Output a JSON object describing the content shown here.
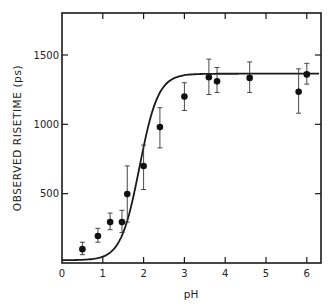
{
  "chart_data": {
    "type": "scatter",
    "title": "",
    "xlabel": "pH",
    "ylabel": "OBSERVED RISETIME (ps)",
    "xlim": [
      0,
      6.3
    ],
    "ylim": [
      0,
      1800
    ],
    "x_ticks": [
      0,
      1,
      2,
      3,
      4,
      5,
      6
    ],
    "y_ticks": [
      500,
      1000,
      1500
    ],
    "x_tick_labels": [
      "0",
      "1",
      "2",
      "3",
      "4",
      "5",
      "6"
    ],
    "y_tick_labels": [
      "500",
      "1000",
      "1500"
    ],
    "grid": false,
    "legend": null,
    "series": [
      {
        "name": "measured",
        "marker": "filled-circle",
        "points": [
          {
            "x": 0.5,
            "y": 100,
            "err_low": 60,
            "err_high": 150
          },
          {
            "x": 0.88,
            "y": 195,
            "err_low": 150,
            "err_high": 250
          },
          {
            "x": 1.18,
            "y": 295,
            "err_low": 240,
            "err_high": 360
          },
          {
            "x": 1.47,
            "y": 295,
            "err_low": 220,
            "err_high": 380
          },
          {
            "x": 1.6,
            "y": 497,
            "err_low": 295,
            "err_high": 700
          },
          {
            "x": 2.0,
            "y": 700,
            "err_low": 530,
            "err_high": 850
          },
          {
            "x": 2.4,
            "y": 980,
            "err_low": 830,
            "err_high": 1120
          },
          {
            "x": 3.0,
            "y": 1200,
            "err_low": 1100,
            "err_high": 1300
          },
          {
            "x": 3.6,
            "y": 1340,
            "err_low": 1215,
            "err_high": 1470
          },
          {
            "x": 3.8,
            "y": 1310,
            "err_low": 1230,
            "err_high": 1410
          },
          {
            "x": 4.6,
            "y": 1335,
            "err_low": 1230,
            "err_high": 1450
          },
          {
            "x": 5.8,
            "y": 1235,
            "err_low": 1080,
            "err_high": 1400
          },
          {
            "x": 6.0,
            "y": 1360,
            "err_low": 1290,
            "err_high": 1440
          }
        ]
      },
      {
        "name": "fit",
        "style": "solid-line",
        "model": "sigmoid",
        "params": {
          "baseline": 20,
          "plateau": 1365,
          "pKa": 1.9,
          "steepness": 1.9
        }
      }
    ]
  }
}
